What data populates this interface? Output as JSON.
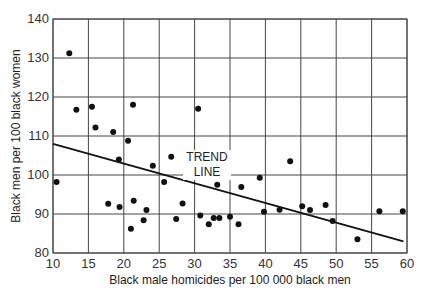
{
  "chart_data": {
    "type": "scatter",
    "title": "",
    "xlabel": "Black male homicides per 100 000 black men",
    "ylabel": "Black men per 100 black women",
    "xlim": [
      10,
      60
    ],
    "ylim": [
      80,
      140
    ],
    "xticks": [
      10,
      15,
      20,
      25,
      30,
      35,
      40,
      45,
      50,
      55,
      60
    ],
    "yticks": [
      80,
      90,
      100,
      110,
      120,
      130,
      140
    ],
    "grid": true,
    "legend": null,
    "annotations": [
      {
        "text_line1": "TREND",
        "text_line2": "LINE",
        "x": 30,
        "y": 101
      }
    ],
    "trend_line": {
      "x": [
        10,
        59.5
      ],
      "y": [
        108,
        83
      ]
    },
    "points": [
      {
        "x": 10.5,
        "y": 98.2
      },
      {
        "x": 12.3,
        "y": 131.2
      },
      {
        "x": 13.3,
        "y": 116.7
      },
      {
        "x": 15.5,
        "y": 117.5
      },
      {
        "x": 16.0,
        "y": 112.2
      },
      {
        "x": 17.8,
        "y": 92.6
      },
      {
        "x": 18.5,
        "y": 111.0
      },
      {
        "x": 19.3,
        "y": 104.0
      },
      {
        "x": 19.4,
        "y": 91.8
      },
      {
        "x": 20.6,
        "y": 108.8
      },
      {
        "x": 21.0,
        "y": 86.2
      },
      {
        "x": 21.3,
        "y": 118.0
      },
      {
        "x": 21.4,
        "y": 93.4
      },
      {
        "x": 22.8,
        "y": 88.4
      },
      {
        "x": 23.2,
        "y": 91.0
      },
      {
        "x": 24.1,
        "y": 102.4
      },
      {
        "x": 25.7,
        "y": 98.2
      },
      {
        "x": 26.7,
        "y": 104.7
      },
      {
        "x": 27.4,
        "y": 88.7
      },
      {
        "x": 28.3,
        "y": 92.7
      },
      {
        "x": 30.5,
        "y": 117.0
      },
      {
        "x": 30.8,
        "y": 89.6
      },
      {
        "x": 32.0,
        "y": 87.4
      },
      {
        "x": 32.7,
        "y": 89.0
      },
      {
        "x": 33.2,
        "y": 97.5
      },
      {
        "x": 33.5,
        "y": 89.0
      },
      {
        "x": 35.0,
        "y": 89.3
      },
      {
        "x": 36.2,
        "y": 87.4
      },
      {
        "x": 36.6,
        "y": 96.9
      },
      {
        "x": 39.2,
        "y": 99.3
      },
      {
        "x": 39.8,
        "y": 90.6
      },
      {
        "x": 42.0,
        "y": 91.1
      },
      {
        "x": 43.5,
        "y": 103.5
      },
      {
        "x": 45.2,
        "y": 92.0
      },
      {
        "x": 46.3,
        "y": 91.0
      },
      {
        "x": 48.5,
        "y": 92.3
      },
      {
        "x": 49.5,
        "y": 88.2
      },
      {
        "x": 53.0,
        "y": 83.5
      },
      {
        "x": 56.1,
        "y": 90.7
      },
      {
        "x": 59.4,
        "y": 90.7
      }
    ],
    "colors": {
      "points": "#111111",
      "grid": "#444444",
      "trend": "#111111"
    }
  }
}
